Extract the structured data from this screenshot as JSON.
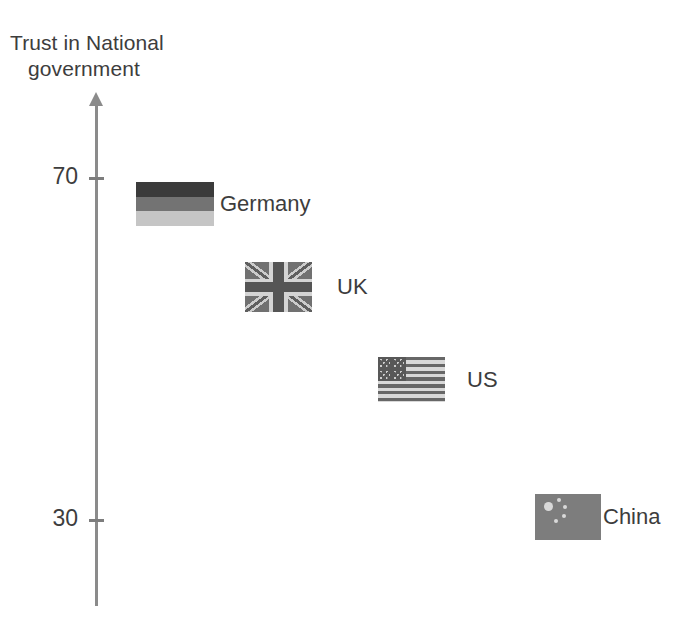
{
  "chart_data": {
    "type": "scatter",
    "title_lines": [
      "Trust in National",
      "government"
    ],
    "xlabel": "",
    "ylabel": "Trust in National government",
    "ylim": [
      20,
      80
    ],
    "yticks": [
      {
        "label": "70",
        "value": 70
      },
      {
        "label": "30",
        "value": 30
      }
    ],
    "grid": false,
    "legend": "none",
    "axis_color": "#8b8b8b",
    "text_color": "#3d3d3d",
    "background": "#ffffff",
    "categories": [
      "Germany",
      "UK",
      "US",
      "China"
    ],
    "values": [
      69,
      60,
      50,
      31
    ],
    "points": [
      {
        "label": "Germany",
        "value": 69,
        "marker": "flag-germany-icon",
        "x_px": 136,
        "y_px": 182,
        "flag_w": 78,
        "flag_h": 44,
        "label_x_px": 220,
        "label_y_px": 191
      },
      {
        "label": "UK",
        "value": 60,
        "marker": "flag-uk-icon",
        "x_px": 245,
        "y_px": 262,
        "flag_w": 67,
        "flag_h": 50,
        "label_x_px": 337,
        "label_y_px": 275
      },
      {
        "label": "US",
        "value": 50,
        "marker": "flag-us-icon",
        "x_px": 378,
        "y_px": 357,
        "flag_w": 67,
        "flag_h": 45,
        "label_x_px": 467,
        "label_y_px": 368
      },
      {
        "label": "China",
        "value": 31,
        "marker": "flag-china-icon",
        "x_px": 535,
        "y_px": 494,
        "flag_w": 66,
        "flag_h": 46,
        "label_x_px": 603,
        "label_y_px": 506
      }
    ]
  },
  "axis": {
    "title_line1": "Trust in National",
    "title_line2": "government",
    "ticks": [
      {
        "label": "70",
        "y_px": 178
      },
      {
        "label": "30",
        "y_px": 520
      }
    ]
  }
}
